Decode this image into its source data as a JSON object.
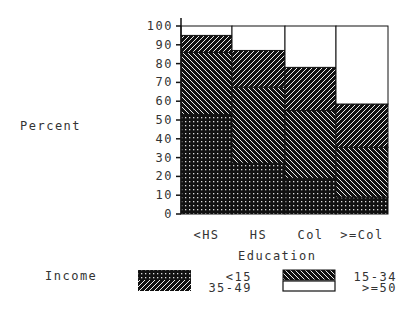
{
  "chart_data": {
    "type": "bar",
    "stacked": true,
    "title": "",
    "xlabel": "Education",
    "ylabel": "Percent",
    "ylim": [
      0,
      100
    ],
    "yticks": [
      0,
      10,
      20,
      30,
      40,
      50,
      60,
      70,
      80,
      90,
      100
    ],
    "categories": [
      "<HS",
      "HS",
      "Col",
      ">=Col"
    ],
    "legend_title": "Income",
    "legend_position": "bottom",
    "grid": false,
    "series": [
      {
        "name": "<15",
        "pattern": "dots",
        "values": [
          53,
          27,
          19,
          9
        ]
      },
      {
        "name": "15-34",
        "pattern": "backslash-hatch",
        "values": [
          33,
          40.5,
          36,
          26.5
        ]
      },
      {
        "name": "35-49",
        "pattern": "slash-hatch",
        "values": [
          9,
          19.5,
          23,
          23
        ]
      },
      {
        "name": ">=50",
        "pattern": "white",
        "values": [
          5,
          13,
          22,
          41.5
        ]
      }
    ]
  },
  "labels": {
    "ylabel": "Percent",
    "xlabel": "Education",
    "legend_title": "Income",
    "legend": [
      "<15",
      "15-34",
      "35-49",
      ">=50"
    ]
  }
}
